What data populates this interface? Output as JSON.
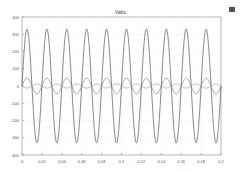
{
  "figure": {
    "title": "Vabc",
    "dock_icon": "undock-icon"
  },
  "chart_data": {
    "type": "line",
    "title": "Vabc",
    "xlabel": "",
    "ylabel": "",
    "xlim": [
      0,
      0.2
    ],
    "ylim": [
      -400,
      400
    ],
    "xticks": [
      0,
      0.02,
      0.04,
      0.06,
      0.08,
      0.1,
      0.12,
      0.14,
      0.16,
      0.18,
      0.2
    ],
    "xtick_labels": [
      "0",
      "0.02",
      "0.04",
      "0.06",
      "0.08",
      "0.1",
      "0.12",
      "0.14",
      "0.16",
      "0.18",
      "0.2"
    ],
    "yticks": [
      400,
      300,
      200,
      100,
      0,
      -100,
      -200,
      -300,
      -400
    ],
    "ytick_labels": [
      "400",
      "300",
      "200",
      "100",
      "0",
      "-100",
      "-200",
      "-300",
      "-400"
    ],
    "grid": true,
    "legend": null,
    "series": [
      {
        "name": "large",
        "kind": "sine",
        "amplitude": 330,
        "frequency_hz": 50,
        "phase_deg": 0,
        "color": "#555555"
      },
      {
        "name": "medium",
        "kind": "sine",
        "amplitude": 45,
        "frequency_hz": 50,
        "phase_deg": 0,
        "color": "#777777"
      },
      {
        "name": "small",
        "kind": "sine",
        "amplitude": 12,
        "frequency_hz": 50,
        "phase_deg": 180,
        "color": "#999999"
      }
    ]
  }
}
